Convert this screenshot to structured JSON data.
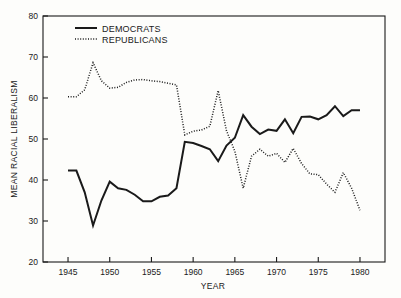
{
  "chart_data": {
    "type": "line",
    "title": "",
    "xlabel": "YEAR",
    "ylabel": "MEAN RACIAL LIBERALISM",
    "xlim": [
      1942,
      1983
    ],
    "ylim": [
      20,
      80
    ],
    "xticks": [
      1945,
      1950,
      1955,
      1960,
      1965,
      1970,
      1975,
      1980
    ],
    "yticks": [
      20,
      30,
      40,
      50,
      60,
      70,
      80
    ],
    "grid": false,
    "legend_position": "top-left",
    "series": [
      {
        "name": "DEMOCRATS",
        "style": "solid",
        "color": "#1a1a1a",
        "x": [
          1945,
          1946,
          1947,
          1948,
          1949,
          1950,
          1951,
          1952,
          1953,
          1954,
          1955,
          1956,
          1957,
          1958,
          1959,
          1960,
          1961,
          1962,
          1963,
          1964,
          1965,
          1966,
          1967,
          1968,
          1969,
          1970,
          1971,
          1972,
          1973,
          1974,
          1975,
          1976,
          1977,
          1978,
          1979,
          1980
        ],
        "values": [
          42.3,
          42.3,
          37.0,
          28.9,
          35.0,
          39.6,
          38.0,
          37.6,
          36.4,
          34.8,
          34.8,
          35.9,
          36.2,
          38.0,
          49.3,
          49.0,
          48.3,
          47.5,
          44.6,
          48.4,
          50.3,
          55.8,
          53.0,
          51.2,
          52.3,
          52.0,
          54.8,
          51.4,
          55.4,
          55.5,
          54.8,
          55.8,
          58.0,
          55.6,
          57.0,
          57.0
        ]
      },
      {
        "name": "REPUBLICANS",
        "style": "dotted",
        "color": "#1a1a1a",
        "x": [
          1945,
          1946,
          1947,
          1948,
          1949,
          1950,
          1951,
          1952,
          1953,
          1954,
          1955,
          1956,
          1957,
          1958,
          1959,
          1960,
          1961,
          1962,
          1963,
          1964,
          1965,
          1966,
          1967,
          1968,
          1969,
          1970,
          1971,
          1972,
          1973,
          1974,
          1975,
          1976,
          1977,
          1978,
          1979,
          1980
        ],
        "values": [
          60.3,
          60.3,
          62.0,
          68.6,
          64.2,
          62.4,
          62.6,
          63.8,
          64.4,
          64.5,
          64.2,
          64.0,
          63.6,
          63.2,
          51.0,
          51.9,
          52.2,
          53.1,
          61.8,
          52.0,
          47.0,
          38.0,
          45.8,
          47.5,
          45.8,
          46.5,
          44.3,
          47.7,
          44.0,
          41.5,
          41.3,
          39.0,
          37.0,
          41.8,
          38.0,
          32.6
        ]
      }
    ]
  },
  "legend": {
    "entries": [
      {
        "label": "DEMOCRATS",
        "style": "solid"
      },
      {
        "label": "REPUBLICANS",
        "style": "dotted"
      }
    ]
  }
}
